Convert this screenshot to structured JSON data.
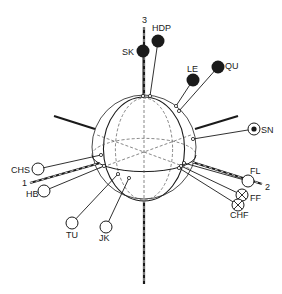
{
  "diagram": {
    "title": "",
    "colors": {
      "ink": "#1a1a1a",
      "background": "#ffffff",
      "dotted": "#555555"
    },
    "sphere": {
      "cx": 144,
      "cy": 147,
      "r": 52
    },
    "axes": [
      {
        "id": "axis-3",
        "label": "3",
        "x1": 144,
        "y1": 27,
        "x2": 144,
        "y2": 96,
        "lx": 142,
        "ly": 23,
        "style": "dashed-thick"
      },
      {
        "id": "axis-3-bottom",
        "label": "",
        "x1": 144,
        "y1": 200,
        "x2": 144,
        "y2": 284,
        "lx": 0,
        "ly": 0,
        "style": "dashed-thick"
      },
      {
        "id": "axis-1",
        "label": "1",
        "x1": 30,
        "y1": 183,
        "x2": 100,
        "y2": 163,
        "lx": 22,
        "ly": 186,
        "style": "dashed-thick"
      },
      {
        "id": "axis-2",
        "label": "2",
        "x1": 192,
        "y1": 162,
        "x2": 262,
        "y2": 184,
        "lx": 265,
        "ly": 190,
        "style": "dashed-thick"
      },
      {
        "id": "axis-upper-left",
        "label": "",
        "x1": 54,
        "y1": 116,
        "x2": 95,
        "y2": 129,
        "lx": 0,
        "ly": 0,
        "style": "solid-thick"
      },
      {
        "id": "axis-upper-right",
        "label": "",
        "x1": 195,
        "y1": 129,
        "x2": 238,
        "y2": 116,
        "lx": 0,
        "ly": 0,
        "style": "solid-thick"
      }
    ],
    "markers": [
      {
        "id": "SK",
        "label": "SK",
        "type": "filled",
        "cx": 143,
        "cy": 51,
        "lx": 122,
        "ly": 55,
        "anchor": "start",
        "fx": 143,
        "fy": 96
      },
      {
        "id": "HDP",
        "label": "HDP",
        "type": "filled",
        "cx": 158,
        "cy": 41,
        "lx": 152,
        "ly": 31,
        "anchor": "start",
        "fx": 150,
        "fy": 96
      },
      {
        "id": "LE",
        "label": "LE",
        "type": "filled",
        "cx": 193,
        "cy": 80,
        "lx": 187,
        "ly": 72,
        "anchor": "start",
        "fx": 176,
        "fy": 106
      },
      {
        "id": "QU",
        "label": "QU",
        "type": "filled",
        "cx": 218,
        "cy": 67,
        "lx": 225,
        "ly": 69,
        "anchor": "start",
        "fx": 179,
        "fy": 111
      },
      {
        "id": "SN",
        "label": "SN",
        "type": "dot",
        "cx": 254,
        "cy": 129,
        "lx": 261,
        "ly": 133,
        "anchor": "start",
        "fx": 193,
        "fy": 139
      },
      {
        "id": "CHS",
        "label": "CHS",
        "type": "open",
        "cx": 38,
        "cy": 169,
        "lx": 11,
        "ly": 173,
        "anchor": "start",
        "fx": 101,
        "fy": 155
      },
      {
        "id": "HB",
        "label": "HB",
        "type": "open",
        "cx": 44,
        "cy": 191,
        "lx": 26,
        "ly": 197,
        "anchor": "start",
        "fx": 104,
        "fy": 166
      },
      {
        "id": "TU",
        "label": "TU",
        "type": "open",
        "cx": 72,
        "cy": 223,
        "lx": 66,
        "ly": 238,
        "anchor": "start",
        "fx": 118,
        "fy": 174
      },
      {
        "id": "JK",
        "label": "JK",
        "type": "open",
        "cx": 106,
        "cy": 227,
        "lx": 99,
        "ly": 241,
        "anchor": "start",
        "fx": 129,
        "fy": 178
      },
      {
        "id": "FL",
        "label": "FL",
        "type": "open",
        "cx": 248,
        "cy": 181,
        "lx": 250,
        "ly": 174,
        "anchor": "start",
        "fx": 184,
        "fy": 163
      },
      {
        "id": "FF",
        "label": "FF",
        "type": "crossed",
        "cx": 242,
        "cy": 195,
        "lx": 250,
        "ly": 201,
        "anchor": "start",
        "fx": 181,
        "fy": 166
      },
      {
        "id": "CHF",
        "label": "CHF",
        "type": "crossed",
        "cx": 238,
        "cy": 205,
        "lx": 230,
        "ly": 218,
        "anchor": "start",
        "fx": 179,
        "fy": 168
      }
    ]
  }
}
